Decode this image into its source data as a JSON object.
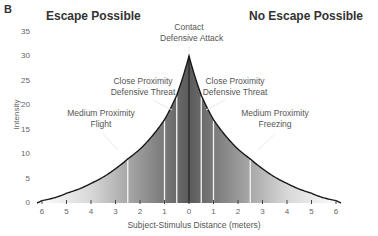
{
  "panel_label": "B",
  "chart_data": {
    "type": "area",
    "title": "",
    "region_titles": {
      "left": "Escape Possible",
      "right": "No Escape Possible"
    },
    "xlabel": "Subject-Stimulus Distance (meters)",
    "ylabel": "Intensity",
    "x_tick_labels": [
      "6",
      "5",
      "4",
      "3",
      "2",
      "1",
      "0",
      "1",
      "2",
      "3",
      "4",
      "5",
      "6"
    ],
    "y_tick_labels": [
      "0",
      "5",
      "10",
      "15",
      "20",
      "25",
      "30",
      "35"
    ],
    "ylim": [
      0,
      35
    ],
    "xlim": [
      -6,
      6
    ],
    "grid": false,
    "legend": null,
    "x": [
      -6,
      -5,
      -4,
      -3,
      -2.5,
      -2,
      -1,
      -0.5,
      0,
      0.5,
      1,
      2,
      2.5,
      3,
      4,
      5,
      6
    ],
    "series": [
      {
        "name": "Defensive intensity",
        "values": [
          0.5,
          2,
          4,
          7,
          9,
          11,
          17,
          22,
          30,
          22,
          17,
          11,
          9,
          7,
          4,
          2,
          0.5
        ]
      }
    ],
    "zone_boundaries_m": [
      0.5,
      1,
      2.5
    ],
    "annotations": [
      {
        "text": "Contact\nDefensive Attack",
        "x": 0,
        "y": 33
      },
      {
        "text": "Close Proximity\nDefensive Threat",
        "x": -1.3,
        "y": 24,
        "side": "left"
      },
      {
        "text": "Close Proximity\nDefensive Threat",
        "x": 1.3,
        "y": 24,
        "side": "right"
      },
      {
        "text": "Medium Proximity\nFlight",
        "x": -3.6,
        "y": 17,
        "side": "left"
      },
      {
        "text": "Medium Proximity\nFreezing",
        "x": 3.6,
        "y": 17,
        "side": "right"
      }
    ]
  },
  "annotations_text": {
    "contact_1": "Contact",
    "contact_2": "Defensive Attack",
    "cp_left_1": "Close Proximity",
    "cp_left_2": "Defensive Threat",
    "cp_right_1": "Close Proximity",
    "cp_right_2": "Defensive Threat",
    "mp_left_1": "Medium Proximity",
    "mp_left_2": "Flight",
    "mp_right_1": "Medium Proximity",
    "mp_right_2": "Freezing"
  }
}
